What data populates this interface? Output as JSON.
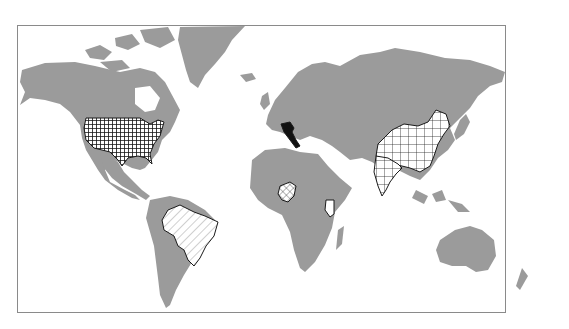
{
  "map": {
    "type": "world-choropleth-pattern",
    "land_color": "#9b9b9b",
    "ocean_color": "#ffffff",
    "frame_color": "#8a8a8a",
    "highlight_outline": "#1a1a1a",
    "highlighted_countries": [
      {
        "name": "United States",
        "pattern": "dense-grid-dark"
      },
      {
        "name": "Italy",
        "pattern": "solid-black"
      },
      {
        "name": "China",
        "pattern": "square-grid"
      },
      {
        "name": "India",
        "pattern": "square-grid"
      },
      {
        "name": "Brazil",
        "pattern": "diagonal-hatch"
      },
      {
        "name": "Nigeria",
        "pattern": "diagonal-crosshatch"
      },
      {
        "name": "Kenya",
        "pattern": "blank-outline"
      }
    ]
  }
}
